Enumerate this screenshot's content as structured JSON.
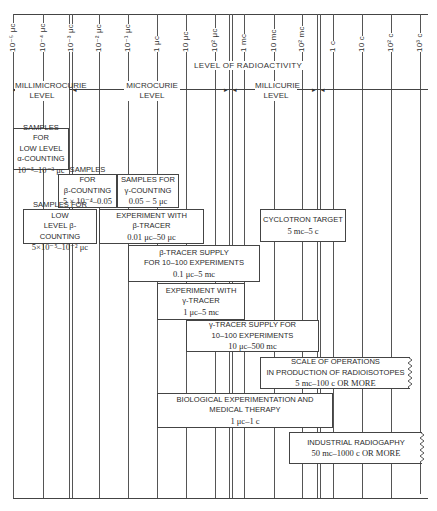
{
  "title": "Level of Radioactivity",
  "axis": {
    "title": "LEVEL OF RADIOACTIVITY",
    "ticks": [
      {
        "label": "10⁻⁵ μc",
        "x": 13
      },
      {
        "label": "10⁻⁴ μc",
        "x": 43
      },
      {
        "label": "10⁻³ μc",
        "x": 70
      },
      {
        "label": "10⁻² μc",
        "x": 99
      },
      {
        "label": "10⁻¹ μc",
        "x": 128
      },
      {
        "label": "1 μc",
        "x": 157
      },
      {
        "label": "10 μc",
        "x": 186
      },
      {
        "label": "10² μc",
        "x": 215
      },
      {
        "label": "1 mc",
        "x": 244
      },
      {
        "label": "10 mc",
        "x": 274
      },
      {
        "label": "10² mc",
        "x": 302
      },
      {
        "label": "1 c",
        "x": 333
      },
      {
        "label": "10 c",
        "x": 362
      },
      {
        "label": "10² c",
        "x": 391
      },
      {
        "label": "10³ c",
        "x": 420
      }
    ]
  },
  "ranges": [
    {
      "label_line1": "MILLIMICROCURIE",
      "label_line2": "LEVEL"
    },
    {
      "label_line1": "MICROCURIE",
      "label_line2": "LEVEL"
    },
    {
      "label_line1": "MILLICURIE",
      "label_line2": "LEVEL"
    }
  ],
  "boxes": [
    {
      "id": "low-level-alpha",
      "lines": [
        "SAMPLES FOR",
        "LOW LEVEL",
        "α-COUNTING"
      ],
      "value": "10⁻⁵–10⁻³ μc"
    },
    {
      "id": "beta-counting",
      "lines": [
        "SAMPLES FOR",
        "β-COUNTING"
      ],
      "value": "5 × 10⁻⁴–0.05 μc"
    },
    {
      "id": "gamma-counting",
      "lines": [
        "SAMPLES FOR",
        "γ-COUNTING"
      ],
      "value": "0.05 − 5 μc"
    },
    {
      "id": "low-level-beta",
      "lines": [
        "SAMPLES FOR LOW",
        "LEVEL β-COUNTING"
      ],
      "value": "5×10⁻⁵–10⁻² μc"
    },
    {
      "id": "beta-tracer-experiment",
      "lines": [
        "EXPERIMENT WITH",
        "β-TRACER"
      ],
      "value": "0.01 μc–50 μc"
    },
    {
      "id": "cyclotron-target",
      "lines": [
        "CYCLOTRON TARGET"
      ],
      "value": "5 mc–5 c"
    },
    {
      "id": "beta-tracer-supply",
      "lines": [
        "β-TRACER SUPPLY",
        "FOR 10–100 EXPERIMENTS"
      ],
      "value": "0.1 μc–5 mc"
    },
    {
      "id": "gamma-tracer-experiment",
      "lines": [
        "EXPERIMENT WITH",
        "γ-TRACER"
      ],
      "value": "1 μc–5 mc"
    },
    {
      "id": "gamma-tracer-supply",
      "lines": [
        "γ-TRACER SUPPLY FOR",
        "10–100 EXPERIMENTS"
      ],
      "value": "10 μc–500 mc"
    },
    {
      "id": "radioisotope-production",
      "lines": [
        "SCALE OF OPERATIONS",
        "IN PRODUCTION OF RADIOISOTOPES"
      ],
      "value": "5 mc–100 c OR MORE"
    },
    {
      "id": "biological-medical",
      "lines": [
        "BIOLOGICAL EXPERIMENTATION AND",
        "MEDICAL THERAPY"
      ],
      "value": "1 μc–1 c"
    },
    {
      "id": "industrial-radiography",
      "lines": [
        "INDUSTRIAL RADIOGAPHY"
      ],
      "value": "50 mc–1000 c OR MORE"
    }
  ]
}
